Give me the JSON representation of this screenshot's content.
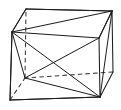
{
  "figure": {
    "kind": "line-drawing",
    "projection": "oblique",
    "canvas": {
      "width": 121,
      "height": 110
    },
    "background_color": "#ffffff",
    "visible_line_color": "#1c1c1c",
    "hidden_line_color": "#3a3a3a",
    "hidden_line_style": "dashed",
    "vertices": {
      "front_top_left": {
        "label": "A",
        "x": 12,
        "y": 32,
        "hidden": false
      },
      "front_top_right": {
        "label": "B",
        "x": 99,
        "y": 38,
        "hidden": false
      },
      "front_bottom_right": {
        "label": "C",
        "x": 100,
        "y": 97,
        "hidden": false
      },
      "front_bottom_left": {
        "label": "D",
        "x": 10,
        "y": 100,
        "hidden": false
      },
      "back_top_left": {
        "label": "E",
        "x": 26,
        "y": 9,
        "hidden": false
      },
      "back_top_right": {
        "label": "F",
        "x": 112,
        "y": 11,
        "hidden": false
      },
      "back_bottom_right": {
        "label": "G",
        "x": 113,
        "y": 72,
        "hidden": false
      },
      "back_bottom_left": {
        "label": "H",
        "x": 25,
        "y": 78,
        "hidden": true
      }
    },
    "edges": [
      {
        "name": "front-top",
        "from": "A",
        "to": "B",
        "hidden": false
      },
      {
        "name": "front-right",
        "from": "B",
        "to": "C",
        "hidden": false
      },
      {
        "name": "front-bottom",
        "from": "C",
        "to": "D",
        "hidden": false
      },
      {
        "name": "front-left",
        "from": "D",
        "to": "A",
        "hidden": false
      },
      {
        "name": "back-top",
        "from": "E",
        "to": "F",
        "hidden": false
      },
      {
        "name": "back-right",
        "from": "F",
        "to": "G",
        "hidden": false
      },
      {
        "name": "back-bottom",
        "from": "G",
        "to": "H",
        "hidden": true
      },
      {
        "name": "back-left",
        "from": "H",
        "to": "E",
        "hidden": true
      },
      {
        "name": "connect-top-left",
        "from": "A",
        "to": "E",
        "hidden": false
      },
      {
        "name": "connect-top-right",
        "from": "B",
        "to": "F",
        "hidden": false
      },
      {
        "name": "connect-bottom-right",
        "from": "C",
        "to": "G",
        "hidden": false
      },
      {
        "name": "connect-bottom-left",
        "from": "D",
        "to": "H",
        "hidden": true
      }
    ],
    "diagonals": [
      {
        "name": "top-face-diagonal",
        "from": "A",
        "to": "F",
        "hidden": false
      },
      {
        "name": "front-face-diagonal-1",
        "from": "A",
        "to": "C",
        "hidden": false
      },
      {
        "name": "front-face-diagonal-2",
        "from": "B",
        "to": "D",
        "hidden": false
      },
      {
        "name": "space-diagonal-1",
        "from": "A",
        "to": "H",
        "hidden": false
      },
      {
        "name": "left-face-diagonal",
        "from": "E",
        "to": "A",
        "hidden": false
      },
      {
        "name": "bottom-left-to-right",
        "from": "H",
        "to": "C",
        "hidden": false
      },
      {
        "name": "bottom-face-diagonal",
        "from": "D",
        "to": "C",
        "hidden": false
      },
      {
        "name": "right-face-diagonal",
        "from": "F",
        "to": "C",
        "hidden": false
      },
      {
        "name": "back-to-front-right",
        "from": "F",
        "to": "B",
        "hidden": false
      },
      {
        "name": "hidden-mid-diagonal",
        "from": "H",
        "to": "G",
        "hidden": true
      }
    ]
  }
}
